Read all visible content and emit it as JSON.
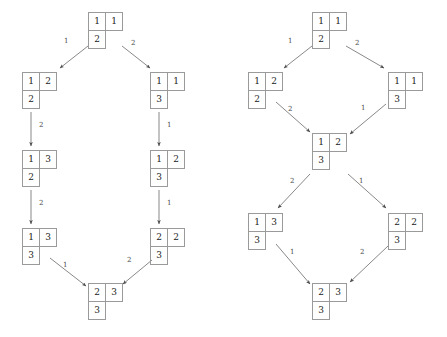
{
  "figure": {
    "type": "diagram",
    "background_color": "#ffffff",
    "box_border_color": "#9a9a9a",
    "arrow_color": "#555555",
    "label_color": "#4a4a4a",
    "cell_size_px": 18
  },
  "diagrams": [
    {
      "id": "left-diagram",
      "name": "left-crystal-graph",
      "nodes": [
        {
          "id": "L0",
          "name": "tableau-L0",
          "x": 88,
          "y": 12,
          "rows": [
            [
              "1",
              "1"
            ],
            [
              "2"
            ]
          ]
        },
        {
          "id": "L1",
          "name": "tableau-L1",
          "x": 22,
          "y": 72,
          "rows": [
            [
              "1",
              "2"
            ],
            [
              "2"
            ]
          ]
        },
        {
          "id": "L2",
          "name": "tableau-L2",
          "x": 150,
          "y": 72,
          "rows": [
            [
              "1",
              "1"
            ],
            [
              "3"
            ]
          ]
        },
        {
          "id": "L3",
          "name": "tableau-L3",
          "x": 22,
          "y": 150,
          "rows": [
            [
              "1",
              "3"
            ],
            [
              "2"
            ]
          ]
        },
        {
          "id": "L4",
          "name": "tableau-L4",
          "x": 150,
          "y": 150,
          "rows": [
            [
              "1",
              "2"
            ],
            [
              "3"
            ]
          ]
        },
        {
          "id": "L5",
          "name": "tableau-L5",
          "x": 22,
          "y": 228,
          "rows": [
            [
              "1",
              "3"
            ],
            [
              "3"
            ]
          ]
        },
        {
          "id": "L6",
          "name": "tableau-L6",
          "x": 150,
          "y": 228,
          "rows": [
            [
              "2",
              "2"
            ],
            [
              "3"
            ]
          ]
        },
        {
          "id": "L7",
          "name": "tableau-L7",
          "x": 88,
          "y": 283,
          "rows": [
            [
              "2",
              "3"
            ],
            [
              "3"
            ]
          ]
        }
      ],
      "edges": [
        {
          "id": "Le1",
          "name": "edge-L0-L1",
          "from": "L0",
          "to": "L1",
          "label": "1",
          "x1": 88,
          "y1": 46,
          "x2": 60,
          "y2": 68,
          "lx": 64,
          "ly": 38
        },
        {
          "id": "Le2",
          "name": "edge-L0-L2",
          "from": "L0",
          "to": "L2",
          "label": "2",
          "x1": 122,
          "y1": 46,
          "x2": 150,
          "y2": 68,
          "lx": 131,
          "ly": 40
        },
        {
          "id": "Le3",
          "name": "edge-L1-L3",
          "from": "L1",
          "to": "L3",
          "label": "2",
          "x1": 31,
          "y1": 112,
          "x2": 31,
          "y2": 146,
          "lx": 39,
          "ly": 122
        },
        {
          "id": "Le4",
          "name": "edge-L2-L4",
          "from": "L2",
          "to": "L4",
          "label": "1",
          "x1": 159,
          "y1": 112,
          "x2": 159,
          "y2": 146,
          "lx": 167,
          "ly": 122
        },
        {
          "id": "Le5",
          "name": "edge-L3-L5",
          "from": "L3",
          "to": "L5",
          "label": "2",
          "x1": 31,
          "y1": 190,
          "x2": 31,
          "y2": 224,
          "lx": 39,
          "ly": 200
        },
        {
          "id": "Le6",
          "name": "edge-L4-L6",
          "from": "L4",
          "to": "L6",
          "label": "1",
          "x1": 159,
          "y1": 190,
          "x2": 159,
          "y2": 224,
          "lx": 167,
          "ly": 200
        },
        {
          "id": "Le7",
          "name": "edge-L5-L7",
          "from": "L5",
          "to": "L7",
          "label": "1",
          "x1": 50,
          "y1": 258,
          "x2": 86,
          "y2": 286,
          "lx": 63,
          "ly": 262
        },
        {
          "id": "Le8",
          "name": "edge-L6-L7",
          "from": "L6",
          "to": "L7",
          "label": "2",
          "x1": 152,
          "y1": 260,
          "x2": 123,
          "y2": 284,
          "lx": 127,
          "ly": 257
        }
      ]
    },
    {
      "id": "right-diagram",
      "name": "right-crystal-graph",
      "nodes": [
        {
          "id": "R0",
          "name": "tableau-R0",
          "x": 312,
          "y": 12,
          "rows": [
            [
              "1",
              "1"
            ],
            [
              "2"
            ]
          ]
        },
        {
          "id": "R1",
          "name": "tableau-R1",
          "x": 248,
          "y": 72,
          "rows": [
            [
              "1",
              "2"
            ],
            [
              "2"
            ]
          ]
        },
        {
          "id": "R2",
          "name": "tableau-R2",
          "x": 388,
          "y": 72,
          "rows": [
            [
              "1",
              "1"
            ],
            [
              "3"
            ]
          ]
        },
        {
          "id": "R3",
          "name": "tableau-R3",
          "x": 312,
          "y": 133,
          "rows": [
            [
              "1",
              "2"
            ],
            [
              "3"
            ]
          ]
        },
        {
          "id": "R4",
          "name": "tableau-R4",
          "x": 248,
          "y": 213,
          "rows": [
            [
              "1",
              "3"
            ],
            [
              "3"
            ]
          ]
        },
        {
          "id": "R5",
          "name": "tableau-R5",
          "x": 388,
          "y": 213,
          "rows": [
            [
              "2",
              "2"
            ],
            [
              "3"
            ]
          ]
        },
        {
          "id": "R6",
          "name": "tableau-R6",
          "x": 312,
          "y": 283,
          "rows": [
            [
              "2",
              "3"
            ],
            [
              "3"
            ]
          ]
        }
      ],
      "edges": [
        {
          "id": "Re1",
          "name": "edge-R0-R1",
          "from": "R0",
          "to": "R1",
          "label": "1",
          "x1": 312,
          "y1": 46,
          "x2": 284,
          "y2": 68,
          "lx": 288,
          "ly": 38
        },
        {
          "id": "Re2",
          "name": "edge-R0-R2",
          "from": "R0",
          "to": "R2",
          "label": "2",
          "x1": 346,
          "y1": 46,
          "x2": 384,
          "y2": 68,
          "lx": 355,
          "ly": 40
        },
        {
          "id": "Re3",
          "name": "edge-R1-R3",
          "from": "R1",
          "to": "R3",
          "label": "2",
          "x1": 276,
          "y1": 102,
          "x2": 310,
          "y2": 132,
          "lx": 288,
          "ly": 106
        },
        {
          "id": "Re4",
          "name": "edge-R2-R3",
          "from": "R2",
          "to": "R3",
          "label": "1",
          "x1": 386,
          "y1": 104,
          "x2": 350,
          "y2": 134,
          "lx": 361,
          "ly": 105
        },
        {
          "id": "Re5",
          "name": "edge-R3-R4",
          "from": "R3",
          "to": "R4",
          "label": "2",
          "x1": 310,
          "y1": 174,
          "x2": 278,
          "y2": 208,
          "lx": 290,
          "ly": 178
        },
        {
          "id": "Re6",
          "name": "edge-R3-R5",
          "from": "R3",
          "to": "R5",
          "label": "1",
          "x1": 348,
          "y1": 174,
          "x2": 386,
          "y2": 208,
          "lx": 359,
          "ly": 178
        },
        {
          "id": "Re7",
          "name": "edge-R4-R6",
          "from": "R4",
          "to": "R6",
          "label": "1",
          "x1": 276,
          "y1": 244,
          "x2": 310,
          "y2": 284,
          "lx": 290,
          "ly": 249
        },
        {
          "id": "Re8",
          "name": "edge-R5-R6",
          "from": "R5",
          "to": "R6",
          "label": "2",
          "x1": 388,
          "y1": 246,
          "x2": 350,
          "y2": 282,
          "lx": 360,
          "ly": 249
        }
      ]
    }
  ]
}
